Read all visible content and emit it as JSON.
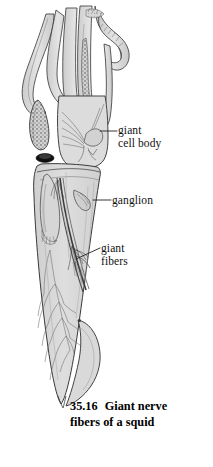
{
  "figure": {
    "number": "35.16",
    "title_line1": "Giant nerve",
    "title_line2": "fibers of a squid",
    "full_caption": "35.16  Giant nerve fibers of a squid",
    "style": "line-drawing-stipple-shaded"
  },
  "labels": [
    {
      "id": "giant-cell-body",
      "line1": "giant",
      "line2": "cell body",
      "text": "giant cell body",
      "leader": {
        "x1": 100,
        "y1": 131,
        "x2": 117,
        "y2": 131
      }
    },
    {
      "id": "ganglion",
      "line1": "ganglion",
      "line2": "",
      "text": "ganglion",
      "leader": {
        "x1": 93,
        "y1": 200,
        "x2": 111,
        "y2": 200
      }
    },
    {
      "id": "giant-fibers",
      "line1": "giant",
      "line2": "fibers",
      "text": "giant fibers",
      "leader": {
        "x1": 76,
        "y1": 259,
        "x2": 100,
        "y2": 248
      }
    }
  ],
  "illustration": {
    "parts": [
      "tentacle-nerve-bundles",
      "stellate-ganglion-oval",
      "dark-pigment-cap",
      "giant-cell-body-region",
      "ganglion-region",
      "mantle-body",
      "giant-fiber-axon",
      "branching-nerve-network",
      "fin-lobe"
    ]
  },
  "colors": {
    "page_background": "#ffffff",
    "tissue_fill": "#dcdcdc",
    "tissue_fill_light": "#e6e6e6",
    "tissue_fill_dark": "#c8c8c8",
    "outline": "#3a3a3a",
    "detail_line": "#6a6a6a",
    "stipple": "#555555",
    "pigment_dark": "#111111",
    "label_text": "#111111",
    "caption_text": "#000000"
  }
}
